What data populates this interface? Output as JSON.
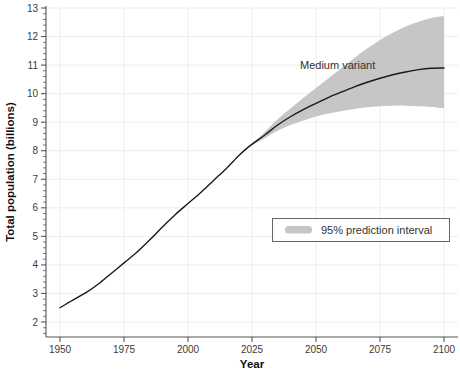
{
  "chart_data": {
    "type": "line",
    "title": "",
    "xlabel": "Year",
    "ylabel": "Total population (billions)",
    "xlim": [
      1950,
      2100
    ],
    "ylim": [
      1.5,
      13
    ],
    "xticks": [
      1950,
      1975,
      2000,
      2025,
      2050,
      2075,
      2100
    ],
    "xtick_labels": [
      "1950",
      "1975",
      "2000",
      "2025",
      "2050",
      "2075",
      "2100"
    ],
    "yticks": [
      2,
      3,
      4,
      5,
      6,
      7,
      8,
      9,
      10,
      11,
      12,
      13
    ],
    "ytick_labels": [
      "2",
      "3",
      "4",
      "5",
      "6",
      "7",
      "8",
      "9",
      "10",
      "11",
      "12",
      "13"
    ],
    "minor_yticks_per_interval": 5,
    "grid": true,
    "legend_position": "center-right",
    "annotations": [
      {
        "text": "Medium variant",
        "x": 2040,
        "y": 11.0
      }
    ],
    "series": [
      {
        "name": "Medium variant",
        "type": "line",
        "color": "#1a1a1a",
        "x": [
          1950,
          1955,
          1960,
          1965,
          1970,
          1975,
          1980,
          1985,
          1990,
          1995,
          2000,
          2005,
          2010,
          2015,
          2020,
          2024,
          2030,
          2035,
          2040,
          2045,
          2050,
          2055,
          2060,
          2065,
          2070,
          2075,
          2080,
          2085,
          2090,
          2095,
          2100
        ],
        "y": [
          2.5,
          2.77,
          3.02,
          3.33,
          3.7,
          4.07,
          4.44,
          4.87,
          5.33,
          5.76,
          6.15,
          6.54,
          6.96,
          7.38,
          7.84,
          8.16,
          8.55,
          8.9,
          9.19,
          9.44,
          9.66,
          9.87,
          10.06,
          10.24,
          10.4,
          10.54,
          10.66,
          10.76,
          10.84,
          10.89,
          10.9
        ]
      },
      {
        "name": "95% prediction interval",
        "type": "band",
        "color": "#c6c6c6",
        "x": [
          2024,
          2030,
          2035,
          2040,
          2045,
          2050,
          2055,
          2060,
          2065,
          2070,
          2075,
          2080,
          2085,
          2090,
          2095,
          2100
        ],
        "y_upper": [
          8.18,
          8.66,
          9.1,
          9.48,
          9.85,
          10.2,
          10.55,
          10.9,
          11.25,
          11.58,
          11.88,
          12.13,
          12.35,
          12.52,
          12.65,
          12.72
        ],
        "y_lower": [
          8.14,
          8.44,
          8.7,
          8.9,
          9.06,
          9.2,
          9.3,
          9.39,
          9.46,
          9.52,
          9.56,
          9.58,
          9.58,
          9.56,
          9.53,
          9.48
        ]
      }
    ]
  },
  "legend": {
    "entries": [
      {
        "label": "95% prediction interval",
        "swatch_color": "#c6c6c6"
      }
    ]
  },
  "colors": {
    "band": "#c6c6c6",
    "line": "#1a1a1a",
    "grid": "#ededed",
    "axis": "#555555",
    "text": "#333333",
    "legend_border": "#666666",
    "background": "#ffffff"
  },
  "axes": {
    "x_title": "Year",
    "y_title": "Total population (billions)"
  }
}
